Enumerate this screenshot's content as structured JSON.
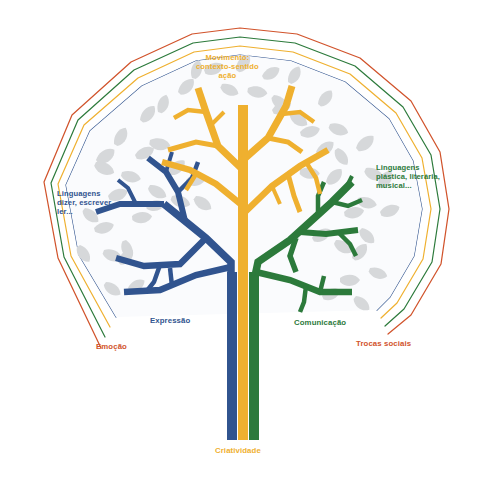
{
  "figure": {
    "background_color": "#FFFFFF"
  },
  "palette": {
    "blue": "#31548F",
    "yellow": "#EFB02F",
    "green": "#2C7A3B",
    "red": "#D1532B",
    "leaf_gray": "#D4D6D8",
    "leaf_gray_light": "#E2E4E6"
  },
  "labels": {
    "canopy_top": {
      "text": "Movimento:\ncontexto-sentido\nação",
      "color": "#EFB02F"
    },
    "canopy_left": {
      "text": "Linguagens\ndizer, escrever,\nler...",
      "color": "#31548F"
    },
    "canopy_right": {
      "text": "Linguagens\nplástica, literária,\nmusical...",
      "color": "#2C7A3B"
    },
    "branch_left_inner": {
      "text": "Expressão",
      "color": "#31548F"
    },
    "contour_left_outer": {
      "text": "Emoção",
      "color": "#D1532B"
    },
    "branch_right_inner": {
      "text": "Comunicação",
      "color": "#2C7A3B"
    },
    "contour_right_outer": {
      "text": "Trocas sociais",
      "color": "#D1532B"
    },
    "trunk_base": {
      "text": "Criatividade",
      "color": "#EFB02F"
    }
  },
  "contours": {
    "order_outer_to_inner": [
      "red",
      "green",
      "yellow",
      "blue"
    ],
    "colors": [
      "#D1532B",
      "#2C7A3B",
      "#EFB02F",
      "#31548F"
    ]
  },
  "trunk": {
    "stripes": [
      "blue",
      "yellow",
      "green"
    ],
    "stripe_colors": [
      "#31548F",
      "#EFB02F",
      "#2C7A3B"
    ]
  }
}
